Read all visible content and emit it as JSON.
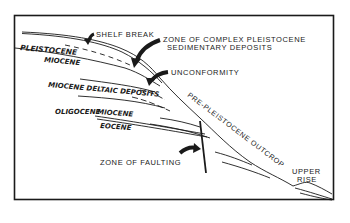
{
  "diagram": {
    "type": "geologic-cross-section",
    "labels": {
      "shelf_break": "SHELF BREAK",
      "complex_zone_line1": "ZONE OF COMPLEX PLEISTOCENE",
      "complex_zone_line2": "SEDIMENTARY DEPOSITS",
      "unconformity": "UNCONFORMITY",
      "pleistocene": "PLEISTOCENE",
      "miocene_upper": "MIOCENE",
      "miocene_deltaic": "MIOCENE DELTAIC DEPOSITS",
      "oligocene": "OLIGOCENE",
      "miocene_lower": "MIOCENE",
      "eocene": "EOCENE",
      "zone_of_faulting": "ZONE OF FAULTING",
      "pre_pleistocene_outcrop": "PRE-PLEISTOCENE OUTCROP",
      "upper_rise_line1": "UPPER",
      "upper_rise_line2": "RISE"
    },
    "colors": {
      "ink": "#1a1a1a",
      "background": "#ffffff"
    }
  }
}
